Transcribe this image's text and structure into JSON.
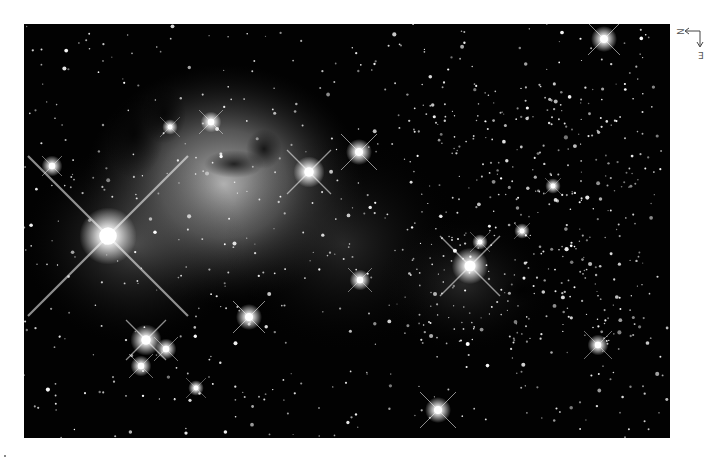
{
  "image": {
    "subject": "star field with emission and dark nebula",
    "background_color": "#020202",
    "nebula_color": "#bdbdbd"
  },
  "compass": {
    "north_label": "N",
    "east_label": "E",
    "north_direction": "left",
    "east_direction": "down"
  },
  "bright_stars": [
    {
      "x": 84,
      "y": 212,
      "r": 11,
      "spikes": 80
    },
    {
      "x": 446,
      "y": 242,
      "r": 7,
      "spikes": 30
    },
    {
      "x": 285,
      "y": 148,
      "r": 6,
      "spikes": 22
    },
    {
      "x": 335,
      "y": 128,
      "r": 5,
      "spikes": 18
    },
    {
      "x": 580,
      "y": 15,
      "r": 5,
      "spikes": 16
    },
    {
      "x": 122,
      "y": 316,
      "r": 6,
      "spikes": 20
    },
    {
      "x": 142,
      "y": 325,
      "r": 4,
      "spikes": 12
    },
    {
      "x": 117,
      "y": 342,
      "r": 4,
      "spikes": 12
    },
    {
      "x": 225,
      "y": 293,
      "r": 5,
      "spikes": 16
    },
    {
      "x": 414,
      "y": 386,
      "r": 5,
      "spikes": 18
    },
    {
      "x": 574,
      "y": 321,
      "r": 4,
      "spikes": 14
    },
    {
      "x": 172,
      "y": 364,
      "r": 3,
      "spikes": 10
    },
    {
      "x": 336,
      "y": 256,
      "r": 4,
      "spikes": 12
    },
    {
      "x": 28,
      "y": 142,
      "r": 4,
      "spikes": 10
    },
    {
      "x": 187,
      "y": 98,
      "r": 4,
      "spikes": 12
    },
    {
      "x": 146,
      "y": 103,
      "r": 3,
      "spikes": 10
    },
    {
      "x": 456,
      "y": 218,
      "r": 3,
      "spikes": 10
    },
    {
      "x": 529,
      "y": 162,
      "r": 3,
      "spikes": 8
    },
    {
      "x": 498,
      "y": 207,
      "r": 3,
      "spikes": 8
    }
  ]
}
